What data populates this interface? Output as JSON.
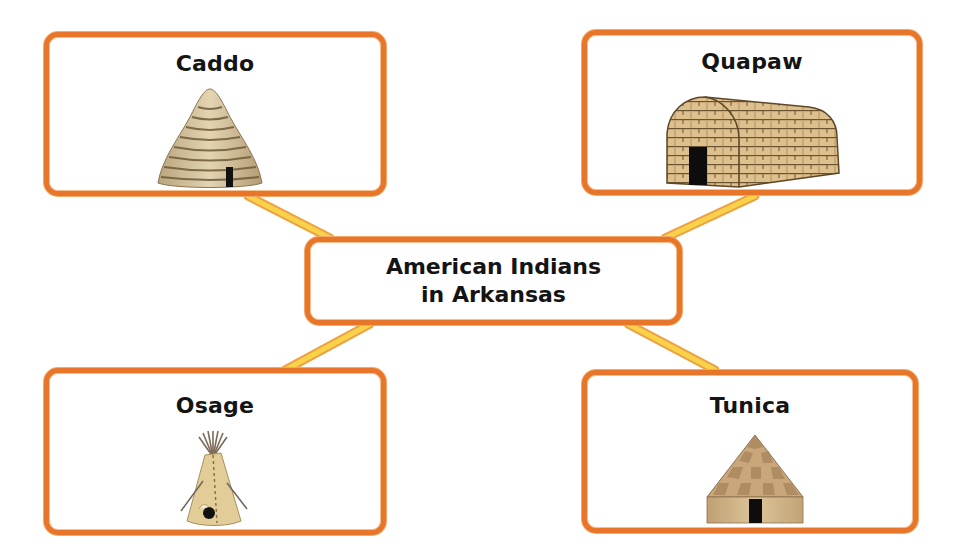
{
  "diagram": {
    "type": "concept-web",
    "center": {
      "line1": "American Indians",
      "line2": "in Arkansas"
    },
    "nodes": [
      {
        "id": "caddo",
        "label": "Caddo",
        "dwelling_icon": "beehive-grass-house-icon",
        "position": "top-left"
      },
      {
        "id": "quapaw",
        "label": "Quapaw",
        "dwelling_icon": "longhouse-icon",
        "position": "top-right"
      },
      {
        "id": "osage",
        "label": "Osage",
        "dwelling_icon": "tipi-icon",
        "position": "bottom-left"
      },
      {
        "id": "tunica",
        "label": "Tunica",
        "dwelling_icon": "thatched-hut-icon",
        "position": "bottom-right"
      }
    ],
    "colors": {
      "box_border": "#E8762A",
      "connector": "#F2C230",
      "text": "#141414",
      "background": "#FFFFFF"
    }
  }
}
